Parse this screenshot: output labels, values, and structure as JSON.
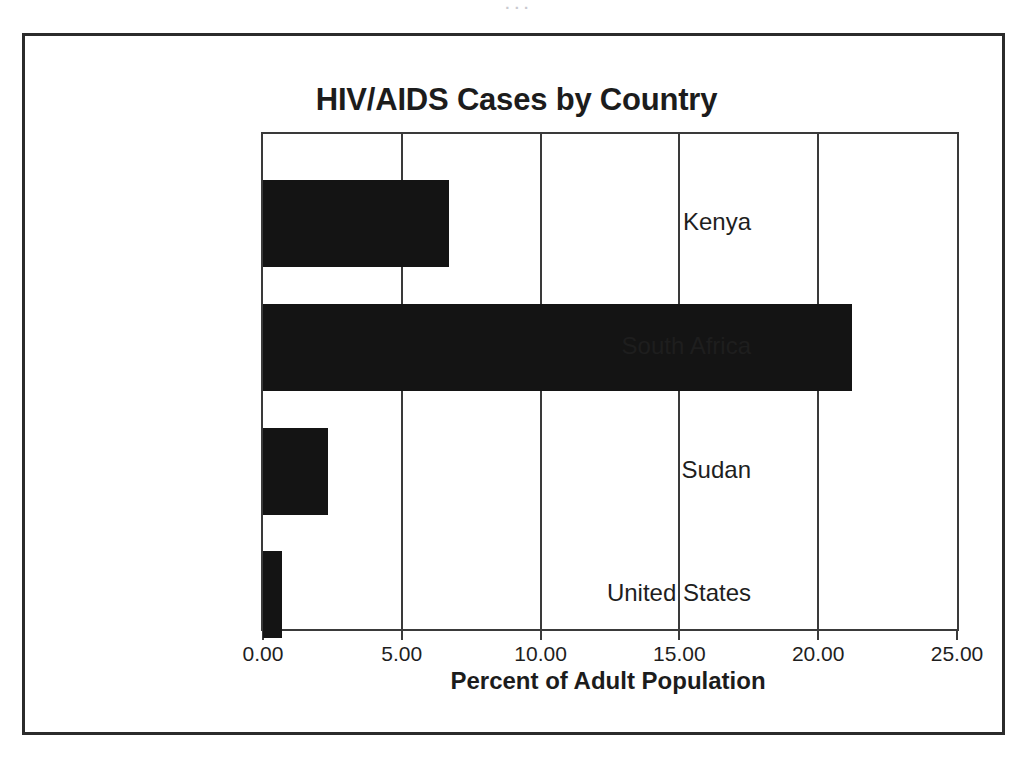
{
  "ghost_text": "  .   .        . ",
  "figure": {
    "title": "HIV/AIDS Cases by Country",
    "x_axis_title": "Percent of Adult Population"
  },
  "chart_data": {
    "type": "bar",
    "orientation": "horizontal",
    "title": "HIV/AIDS Cases by Country",
    "xlabel": "Percent of Adult Population",
    "ylabel": "",
    "categories": [
      "Kenya",
      "South Africa",
      "Sudan",
      "United States"
    ],
    "values": [
      6.7,
      21.2,
      2.35,
      0.7
    ],
    "series": [
      {
        "name": "Percent of Adult Population",
        "values": [
          6.7,
          21.2,
          2.35,
          0.7
        ],
        "color": "#141414"
      }
    ],
    "xlim": [
      0,
      25
    ],
    "xticks": [
      0,
      5,
      10,
      15,
      20,
      25
    ],
    "xtick_labels": [
      "0.00",
      "5.00",
      "10.00",
      "15.00",
      "20.00",
      "25.00"
    ],
    "grid": "vertical",
    "legend": "none",
    "bar_color": "#141414",
    "axis_color": "#3a3a3a",
    "frame_color": "#2b2b2b"
  }
}
